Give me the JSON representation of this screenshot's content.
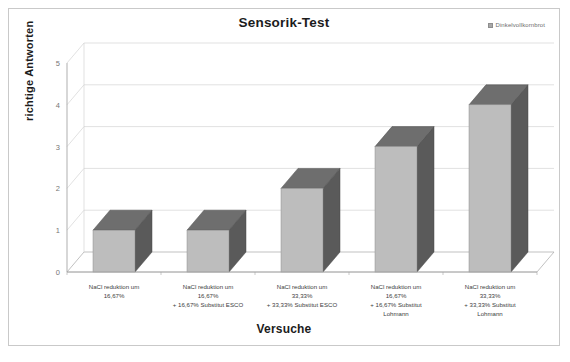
{
  "chart_data": {
    "type": "bar",
    "title": "Sensorik-Test",
    "xlabel": "Versuche",
    "ylabel": "richtige Antworten",
    "legend": [
      "Dinkelvollkornbrot"
    ],
    "legend_position": "top-right",
    "grid": true,
    "style": "3d-column",
    "ylim": [
      0,
      5
    ],
    "yticks": [
      "0",
      "1",
      "2",
      "3",
      "4",
      "5"
    ],
    "categories": [
      "NaCl reduktion um 16,67%",
      "NaCl reduktion um 16,67% + 16,67% Substitut ESCO",
      "NaCl reduktion um 33,33% + 33,33% Substitut ESCO",
      "NaCl reduktion um 16,67% + 16,67% Substitut Lohmann",
      "NaCl reduktion um 33,33% + 33,33% Substitut Lohmann"
    ],
    "category_lines": [
      [
        "NaCl reduktion um",
        "16,67%"
      ],
      [
        "NaCl reduktion um",
        "16,67%",
        "+ 16,67% Substitut ESCO"
      ],
      [
        "NaCl reduktion um",
        "33,33%",
        "+ 33,33% Substitut ESCO"
      ],
      [
        "NaCl reduktion um",
        "16,67%",
        "+ 16,67% Substitut",
        "Lohmann"
      ],
      [
        "NaCl reduktion um",
        "33,33%",
        "+ 33,33% Substitut",
        "Lohmann"
      ]
    ],
    "values": [
      1,
      1,
      2,
      3,
      4
    ],
    "series": [
      {
        "name": "Dinkelvollkornbrot",
        "values": [
          1,
          1,
          2,
          3,
          4
        ]
      }
    ],
    "colors": {
      "bar_front": "#bdbdbd",
      "bar_side": "#5a5a5a",
      "bar_top": "#6e6e6e",
      "grid": "#d4d4d4",
      "axis": "#a6a6a6",
      "frame": "#c9c9c9",
      "text": "#1c1c1c"
    }
  }
}
